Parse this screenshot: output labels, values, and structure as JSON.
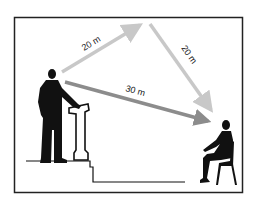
{
  "diagram": {
    "paths": [
      {
        "id": "reflected-up",
        "label": "20 m",
        "color": "#c8c8c8"
      },
      {
        "id": "reflected-down",
        "label": "20 m",
        "color": "#c8c8c8"
      },
      {
        "id": "direct",
        "label": "30 m",
        "color": "#8c8c8c"
      }
    ],
    "frame_color": "#222222",
    "figure_color": "#111111"
  }
}
